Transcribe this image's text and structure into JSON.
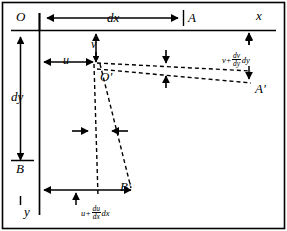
{
  "figure": {
    "type": "fluid-element-deformation-diagram",
    "border_color": "#000000",
    "line_color": "#000000",
    "background": "#ffffff"
  },
  "labels": {
    "origin": "O",
    "point_a": "A",
    "point_b": "B",
    "point_o_prime": "O'",
    "point_a_prime": "A'",
    "point_b_prime": "B'",
    "axis_x": "x",
    "axis_y": "y",
    "dim_dx": "dx",
    "dim_dy": "dy",
    "vel_u": "u",
    "vel_v": "v"
  },
  "expressions": {
    "v_plus_dvdy_dy": {
      "base": "v",
      "plus": "+",
      "numerator": "dv",
      "denominator": "dy",
      "trailing": "dy"
    },
    "u_plus_dudx_dx": {
      "base": "u",
      "plus": "+",
      "numerator": "du",
      "denominator": "dx",
      "trailing": "dx"
    }
  }
}
